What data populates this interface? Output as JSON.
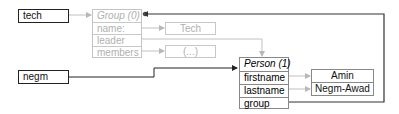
{
  "variables": [
    {
      "id": "tech",
      "label": "tech"
    },
    {
      "id": "negm",
      "label": "negm"
    }
  ],
  "objects": {
    "group": {
      "title": "Group (0)",
      "faded": true,
      "fields": [
        "name:",
        "leader",
        "members"
      ]
    },
    "person": {
      "title": "Person (1)",
      "faded": false,
      "fields": [
        "firstname",
        "lastname",
        "group"
      ]
    }
  },
  "values": {
    "group_name": "Tech",
    "group_members": "(...)",
    "person_firstname": "Amin",
    "person_lastname": "Negm-Awad"
  },
  "colors": {
    "strong_line": "#333333",
    "faded_line": "#c0c0c0"
  }
}
